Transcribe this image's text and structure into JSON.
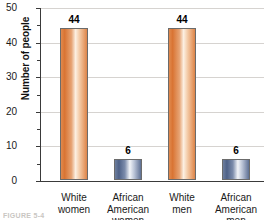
{
  "chart_data": {
    "type": "bar",
    "title": "",
    "xlabel": "",
    "ylabel": "Number of people",
    "categories": [
      "White women",
      "African American women",
      "White men",
      "African American men"
    ],
    "category_lines": [
      [
        "White",
        "women"
      ],
      [
        "African",
        "American",
        "women"
      ],
      [
        "White",
        "men"
      ],
      [
        "African",
        "American",
        "men"
      ]
    ],
    "values": [
      44,
      6,
      44,
      6
    ],
    "value_labels": [
      "44",
      "6",
      "44",
      "6"
    ],
    "bar_colors": [
      "#dd8448",
      "#5e7194",
      "#dd8448",
      "#5e7194"
    ],
    "bar_color_names": [
      "orange",
      "blue",
      "orange",
      "blue"
    ],
    "ylim": [
      0,
      50
    ],
    "ytick_values": [
      50,
      40,
      30,
      20,
      10,
      0
    ],
    "ytick_labels": [
      "50",
      "40",
      "30",
      "20",
      "10",
      "0"
    ],
    "yminor_values": [
      45,
      35,
      25,
      15,
      5
    ],
    "grid": true,
    "grid_axis": "y",
    "legend": "none"
  },
  "figure": {
    "caption": "FIGURE 5-4",
    "axis_color": "#3a3a3a",
    "gridline_color": "#d6d3d0",
    "background": "#ffffff"
  }
}
